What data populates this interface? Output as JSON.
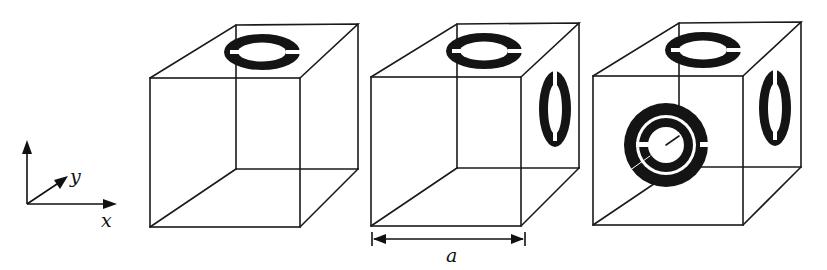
{
  "figure": {
    "axes": {
      "x_label": "x",
      "y_label": "y"
    },
    "dimension": {
      "label": "a"
    },
    "cubes": [
      {
        "id": 1,
        "rings": [
          "top"
        ]
      },
      {
        "id": 2,
        "rings": [
          "top",
          "right-side"
        ]
      },
      {
        "id": 3,
        "rings": [
          "top",
          "right-side",
          "front-double"
        ]
      }
    ],
    "colors": {
      "line": "#1a1a1a",
      "ring": "#141414",
      "background": "#ffffff"
    }
  }
}
